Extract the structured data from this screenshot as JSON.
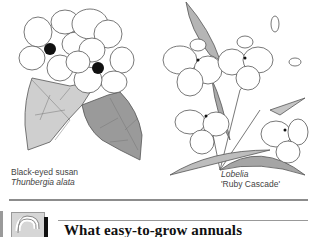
{
  "illustrations": {
    "left": {
      "common_name": "Black-eyed susan",
      "latin_name": "Thunbergia alata"
    },
    "right": {
      "latin_name": "Lobelia",
      "cultivar": "'Ruby Cascade'"
    }
  },
  "section": {
    "number": "2",
    "heading": "What easy-to-grow annuals"
  }
}
